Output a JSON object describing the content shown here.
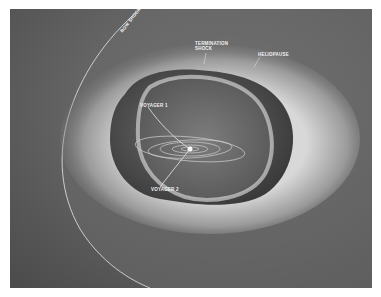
{
  "figure": {
    "background_color": "#5a5a5a",
    "labels": {
      "bow_shock": "BOW SHOCK",
      "termination_shock": "TERMINATION SHOCK",
      "heliopause": "HELIOPAUSE",
      "voyager_1": "VOYAGER 1",
      "voyager_2": "VOYAGER 2"
    }
  }
}
